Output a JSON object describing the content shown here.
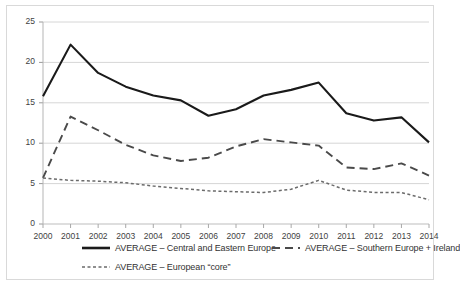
{
  "chart_data": {
    "type": "line",
    "title": "",
    "xlabel": "",
    "ylabel": "",
    "xlim": [
      2000,
      2014
    ],
    "ylim": [
      0,
      25
    ],
    "ytick_step": 5,
    "grid": true,
    "legend_position": "bottom",
    "categories": [
      "2000",
      "2001",
      "2002",
      "2003",
      "2004",
      "2005",
      "2006",
      "2007",
      "2008",
      "2009",
      "2010",
      "2011",
      "2012",
      "2013",
      "2014"
    ],
    "yticks": [
      "0",
      "5",
      "10",
      "15",
      "20",
      "25"
    ],
    "series": [
      {
        "name": "AVERAGE – Central and Eastern Europe",
        "style": "solid",
        "color": "#1a1a1a",
        "values": [
          15.8,
          22.2,
          18.7,
          17.0,
          15.9,
          15.3,
          13.4,
          14.2,
          15.9,
          16.6,
          17.5,
          13.7,
          12.8,
          13.2,
          10.1
        ]
      },
      {
        "name": "AVERAGE – Southern Europe + Ireland",
        "style": "dashed",
        "color": "#4a4a4a",
        "values": [
          5.7,
          13.3,
          11.6,
          9.8,
          8.5,
          7.8,
          8.2,
          9.6,
          10.5,
          10.1,
          9.7,
          7.0,
          6.8,
          7.5,
          6.0
        ]
      },
      {
        "name": "AVERAGE – European “core”",
        "style": "dotted",
        "color": "#6b6b6b",
        "values": [
          5.7,
          5.4,
          5.3,
          5.1,
          4.7,
          4.4,
          4.1,
          4.0,
          3.9,
          4.3,
          5.4,
          4.2,
          3.9,
          3.9,
          3.0
        ]
      }
    ]
  },
  "legend": {
    "entries": [
      {
        "label": "AVERAGE – Central and Eastern Europe",
        "style": "solid"
      },
      {
        "label": "AVERAGE – Southern Europe + Ireland",
        "style": "dashed"
      },
      {
        "label": "AVERAGE – European “core”",
        "style": "dotted"
      }
    ]
  }
}
